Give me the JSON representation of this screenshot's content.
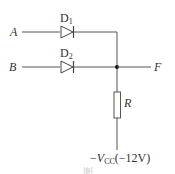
{
  "diagram": {
    "type": "diode OR gate circuit",
    "inputs": [
      {
        "label": "A",
        "diode": {
          "name": "D",
          "sub": "1"
        }
      },
      {
        "label": "B",
        "diode": {
          "name": "D",
          "sub": "2"
        }
      }
    ],
    "output": {
      "label": "F"
    },
    "resistor": {
      "label": "R"
    },
    "supply": {
      "prefix": "−",
      "symbol": "V",
      "sub": "CC",
      "value": "(−12V)"
    },
    "caption_partial": "图",
    "colors": {
      "wire": "#555555",
      "text": "#333333",
      "node": "#111111"
    }
  }
}
